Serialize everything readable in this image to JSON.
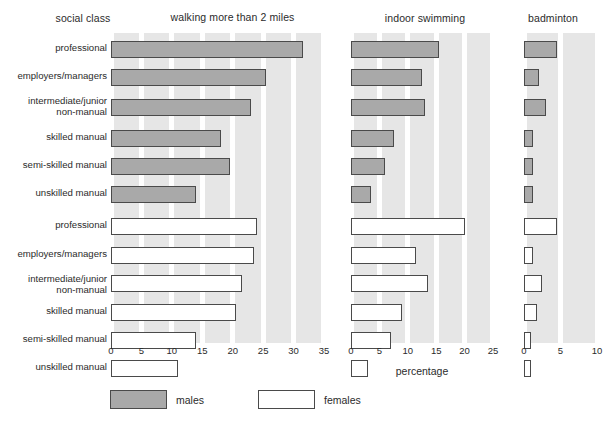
{
  "panels": {
    "social_class_header": "social class",
    "walking_header": "walking more than 2 miles",
    "swimming_header": "indoor swimming",
    "badminton_header": "badminton"
  },
  "axis": {
    "xlabel": "percentage",
    "walking_ticks": [
      "0",
      "5",
      "10",
      "15",
      "20",
      "25",
      "30",
      "35"
    ],
    "swimming_ticks": [
      "0",
      "5",
      "10",
      "15",
      "20",
      "25"
    ],
    "badminton_ticks": [
      "0",
      "5",
      "10"
    ]
  },
  "legend": {
    "males_label": "males",
    "females_label": "females",
    "male_color": "#a9a9a9",
    "female_color": "#ffffff",
    "border_color": "#4a4a4a",
    "band_color": "#e6e6e6"
  },
  "categories": [
    "professional",
    "employers/managers",
    "intermediate/junior\nnon-manual",
    "skilled manual",
    "semi-skilled manual",
    "unskilled manual",
    "professional",
    "employers/managers",
    "intermediate/junior\nnon-manual",
    "skilled manual",
    "semi-skilled manual",
    "unskilled manual"
  ],
  "chart_data": {
    "type": "bar",
    "xlabel": "percentage",
    "ylabel": "social class",
    "orientation": "horizontal",
    "grid": "vertical banded",
    "legend_position": "bottom-left",
    "categories": [
      "professional",
      "employers/managers",
      "intermediate/junior non-manual",
      "skilled manual",
      "semi-skilled manual",
      "unskilled manual"
    ],
    "panels": [
      {
        "name": "walking more than 2 miles",
        "xlim": [
          0,
          35
        ],
        "xticks": [
          0,
          5,
          10,
          15,
          20,
          25,
          30,
          35
        ],
        "series": [
          {
            "name": "males",
            "values": [
              31.5,
              25.5,
              23.0,
              18.0,
              19.5,
              14.0
            ]
          },
          {
            "name": "females",
            "values": [
              24.0,
              23.5,
              21.5,
              20.5,
              14.0,
              11.0
            ]
          }
        ]
      },
      {
        "name": "indoor swimming",
        "xlim": [
          0,
          25
        ],
        "xticks": [
          0,
          5,
          10,
          15,
          20,
          25
        ],
        "series": [
          {
            "name": "males",
            "values": [
              15.5,
              12.5,
              13.0,
              7.5,
              6.0,
              3.5
            ]
          },
          {
            "name": "females",
            "values": [
              20.0,
              11.5,
              13.5,
              9.0,
              7.0,
              3.0
            ]
          }
        ]
      },
      {
        "name": "badminton",
        "xlim": [
          0,
          10
        ],
        "xticks": [
          0,
          5,
          10
        ],
        "series": [
          {
            "name": "males",
            "values": [
              4.5,
              2.0,
              3.0,
              1.3,
              1.3,
              1.3
            ]
          },
          {
            "name": "females",
            "values": [
              4.5,
              1.3,
              2.5,
              1.8,
              1.0,
              1.0
            ]
          }
        ]
      }
    ]
  }
}
